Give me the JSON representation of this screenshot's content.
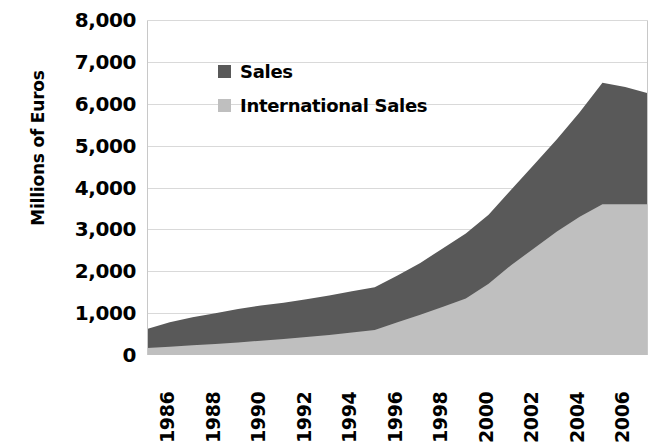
{
  "chart_data": {
    "type": "area",
    "stacked": true,
    "title": "",
    "xlabel": "",
    "ylabel": "Millions of Euros",
    "ylim": [
      0,
      8000
    ],
    "ytick_labels": [
      "8,000",
      "7,000",
      "6,000",
      "5,000",
      "4,000",
      "3,000",
      "2,000",
      "1,000",
      "0"
    ],
    "ytick_values": [
      8000,
      7000,
      6000,
      5000,
      4000,
      3000,
      2000,
      1000,
      0
    ],
    "xtick_labels": [
      "1986",
      "1988",
      "1990",
      "1992",
      "1994",
      "1996",
      "1998",
      "2000",
      "2002",
      "2004",
      "2006",
      "2008"
    ],
    "xlim": [
      1986,
      2008
    ],
    "grid": true,
    "grid_axis": "y",
    "legend_position": "upper-left-inside",
    "x": [
      1986,
      1987,
      1988,
      1989,
      1990,
      1991,
      1992,
      1993,
      1994,
      1995,
      1996,
      1997,
      1998,
      1999,
      2000,
      2001,
      2002,
      2003,
      2004,
      2005,
      2006,
      2007,
      2008
    ],
    "series": [
      {
        "name": "International Sales",
        "color": "#bfbfbf",
        "values": [
          170,
          200,
          230,
          260,
          300,
          340,
          380,
          430,
          480,
          540,
          600,
          780,
          960,
          1150,
          1350,
          1700,
          2150,
          2550,
          2950,
          3300,
          3600,
          3600,
          3600
        ]
      },
      {
        "name": "Sales",
        "color": "#595959",
        "note": "Total (stacked top) values shown below",
        "values": [
          620,
          780,
          900,
          1000,
          1100,
          1180,
          1250,
          1330,
          1420,
          1520,
          1620,
          1900,
          2200,
          2550,
          2900,
          3350,
          3950,
          4550,
          5150,
          5800,
          6500,
          6400,
          6250
        ]
      }
    ],
    "totals_note": "Sales series is drawn as the stacked total line; International Sales is the lower band."
  },
  "legend": {
    "items": [
      {
        "label": "Sales",
        "color": "#595959",
        "swatch": "legend-swatch-sales"
      },
      {
        "label": "International Sales",
        "color": "#bfbfbf",
        "swatch": "legend-swatch-international-sales"
      }
    ]
  },
  "axes": {
    "y_title": "Millions of Euros"
  },
  "colors": {
    "sales": "#595959",
    "international_sales": "#bfbfbf",
    "grid": "#d9d9d9",
    "axis": "#c8c8c8",
    "text": "#000000",
    "background": "#ffffff"
  }
}
